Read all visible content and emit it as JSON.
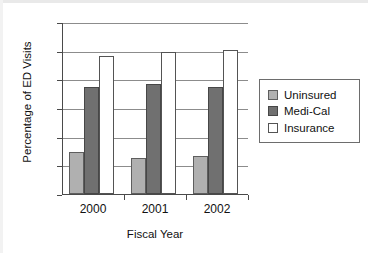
{
  "chart_data": {
    "type": "bar",
    "title": "",
    "xlabel": "Fiscal Year",
    "ylabel": "Percentage of ED Visits",
    "categories": [
      "2000",
      "2001",
      "2002"
    ],
    "series": [
      {
        "name": "Uninsured",
        "color": "#b0b0b0",
        "values": [
          14.6,
          12.6,
          13.2
        ]
      },
      {
        "name": "Medi-Cal",
        "color": "#707070",
        "values": [
          37.5,
          38.5,
          37.5
        ]
      },
      {
        "name": "Insurance",
        "color": "#ffffff",
        "values": [
          48.0,
          49.7,
          50.3
        ]
      }
    ],
    "ylim": [
      0,
      60
    ],
    "ytick_labels": [
      "0",
      "10",
      "20",
      "30",
      "40",
      "50",
      "60"
    ],
    "ytick_values": [
      0,
      10,
      20,
      30,
      40,
      50,
      60
    ],
    "grid": "horizontal",
    "legend_position": "right",
    "legend_entries": [
      "Uninsured",
      "Medi-Cal",
      "Insurance"
    ]
  },
  "axes": {
    "y_title": "Percentage of ED Visits",
    "x_title": "Fiscal Year",
    "y_ticks": [
      "0",
      "10",
      "20",
      "30",
      "40",
      "50",
      "60"
    ],
    "x_ticks": [
      "2000",
      "2001",
      "2002"
    ]
  },
  "legend": {
    "items": [
      {
        "label": "Uninsured",
        "swatch": "light-gray-swatch"
      },
      {
        "label": "Medi-Cal",
        "swatch": "dark-gray-swatch"
      },
      {
        "label": "Insurance",
        "swatch": "white-swatch"
      }
    ]
  }
}
